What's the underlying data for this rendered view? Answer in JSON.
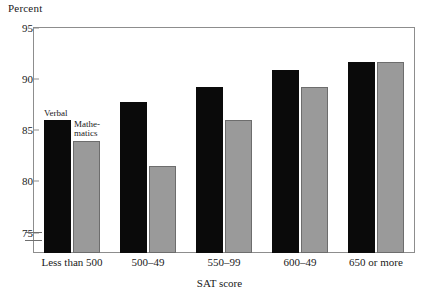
{
  "chart_data": {
    "type": "bar",
    "title": "Percent",
    "xlabel": "SAT score",
    "ylabel": "Percent",
    "ylim": [
      73,
      95
    ],
    "yticks": [
      75,
      80,
      85,
      90,
      95
    ],
    "ytick_labels": [
      "75",
      "80",
      "85",
      "90",
      "95"
    ],
    "axis_break": true,
    "grid": false,
    "legend_position": "inline-first-group",
    "categories": [
      "Less than 500",
      "500–49",
      "550–99",
      "600–49",
      "650 or more"
    ],
    "series": [
      {
        "name": "Verbal",
        "color": "#0a0a0a",
        "values": [
          86.0,
          87.8,
          89.2,
          90.9,
          91.7
        ]
      },
      {
        "name": "Mathe-\nmatics",
        "color": "#9a9a9a",
        "values": [
          84.0,
          81.5,
          86.0,
          89.2,
          91.7
        ]
      }
    ]
  },
  "legend": {
    "verbal_label": "Verbal",
    "mathematics_label": "Mathe-​matics",
    "mathematics_line1": "Mathe-",
    "mathematics_line2": "matics"
  }
}
